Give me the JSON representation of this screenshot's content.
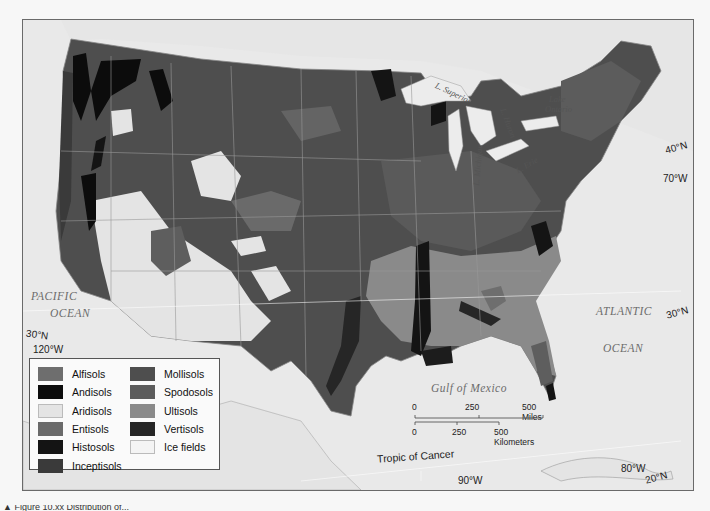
{
  "map": {
    "subject": "Distribution of soil orders in the United States",
    "oceans": {
      "pacific_line1": "PACIFIC",
      "pacific_line2": "OCEAN",
      "atlantic_line1": "ATLANTIC",
      "atlantic_line2": "OCEAN",
      "gulf": "Gulf of Mexico"
    },
    "lakes": {
      "superior": "L. Superior",
      "michigan": "L. Michigan",
      "huron": "L. Huron",
      "erie": "L. Erie",
      "ontario_line1": "Lake",
      "ontario_line2": "Ontario"
    },
    "coordinates": {
      "lat_40_right": "40°N",
      "lon_70": "70°W",
      "lat_30_right": "30°N",
      "lat_30_left": "30°N",
      "lon_120": "120°W",
      "lon_90": "90°W",
      "lon_80": "80°W",
      "lat_20": "20°N"
    },
    "tropic_label": "Tropic of Cancer",
    "scale": {
      "miles": [
        "0",
        "250",
        "500 Miles"
      ],
      "kilometers": [
        "0",
        "250",
        "500 Kilometers"
      ]
    }
  },
  "legend": {
    "items": [
      {
        "label": "Alfisols",
        "color": "#6e6e6e"
      },
      {
        "label": "Andisols",
        "color": "#0c0c0c"
      },
      {
        "label": "Aridisols",
        "color": "#e4e4e4"
      },
      {
        "label": "Entisols",
        "color": "#6a6a6a"
      },
      {
        "label": "Histosols",
        "color": "#141414"
      },
      {
        "label": "Inceptisols",
        "color": "#3a3a3a"
      },
      {
        "label": "Mollisols",
        "color": "#4e4e4e"
      },
      {
        "label": "Spodosols",
        "color": "#5c5c5c"
      },
      {
        "label": "Ultisols",
        "color": "#8a8a8a"
      },
      {
        "label": "Vertisols",
        "color": "#262626"
      },
      {
        "label": "Ice fields",
        "color": "#f4f4f4"
      }
    ]
  },
  "caption": {
    "partial_text": "▲ Figure 10.xx Distribution of..."
  }
}
